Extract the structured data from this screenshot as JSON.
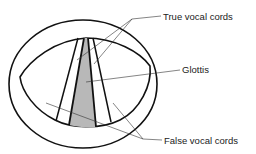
{
  "diagram": {
    "labels": {
      "true_vocal_cords": "True vocal cords",
      "glottis": "Glottis",
      "false_vocal_cords": "False vocal cords"
    },
    "colors": {
      "outline": "#111111",
      "glottis_fill": "#b8b8b8",
      "leader_line": "#333333"
    }
  }
}
